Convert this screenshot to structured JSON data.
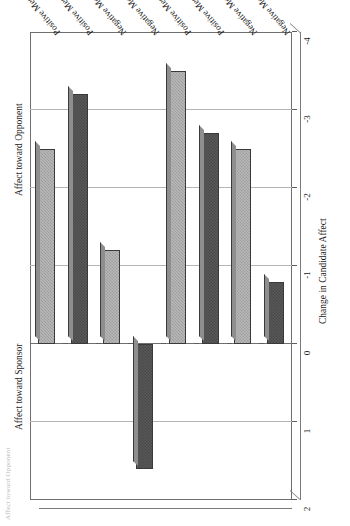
{
  "figure": {
    "clipped_caption": "Affect toward Opponent",
    "group_headings": [
      {
        "label": "Affect toward Sponsor"
      },
      {
        "label": "Affect toward Opponent"
      }
    ]
  },
  "chart_data": {
    "type": "bar",
    "title": "",
    "xlabel": "",
    "ylabel": "Change in Candidate Affect",
    "ylim": [
      -4,
      2
    ],
    "yticks": [
      "2",
      "1",
      "0",
      "-1",
      "-2",
      "-3",
      "-4"
    ],
    "ytick_values": [
      2,
      1,
      0,
      -1,
      -2,
      -3,
      -4
    ],
    "grid": true,
    "legend": "none",
    "orientation": "horizontal-bars-rotated",
    "group_labels": [
      "Affect toward Sponsor",
      "Affect toward Opponent"
    ],
    "categories": [
      "Positive Message",
      "Positive Message + Enthusiasm Cues",
      "Negative Message",
      "Negative Message + Fear Cues",
      "Positive Message",
      "Positive Message + Enthusiasm Cues",
      "Negative Message",
      "Negative Message + Fear Cues"
    ],
    "bars": [
      {
        "label": "Positive Message",
        "group": "Affect toward Sponsor",
        "value": -2.5,
        "shade": "light"
      },
      {
        "label": "Positive Message + Enthusiasm Cues",
        "group": "Affect toward Sponsor",
        "value": -3.2,
        "shade": "dark"
      },
      {
        "label": "Negative Message",
        "group": "Affect toward Sponsor",
        "value": -1.2,
        "shade": "light"
      },
      {
        "label": "Negative Message + Fear Cues",
        "group": "Affect toward Sponsor",
        "value": 1.6,
        "shade": "dark"
      },
      {
        "label": "Positive Message",
        "group": "Affect toward Opponent",
        "value": -3.5,
        "shade": "light"
      },
      {
        "label": "Positive Message + Enthusiasm Cues",
        "group": "Affect toward Opponent",
        "value": -2.7,
        "shade": "dark"
      },
      {
        "label": "Negative Message",
        "group": "Affect toward Opponent",
        "value": -2.5,
        "shade": "light"
      },
      {
        "label": "Negative Message + Fear Cues",
        "group": "Affect toward Opponent",
        "value": -0.8,
        "shade": "dark"
      }
    ],
    "colors": {
      "dark_bar": "#595959",
      "light_bar": "#b7b7b7",
      "gridline": "#b5b5b5",
      "axis": "#6f6f6f"
    }
  }
}
